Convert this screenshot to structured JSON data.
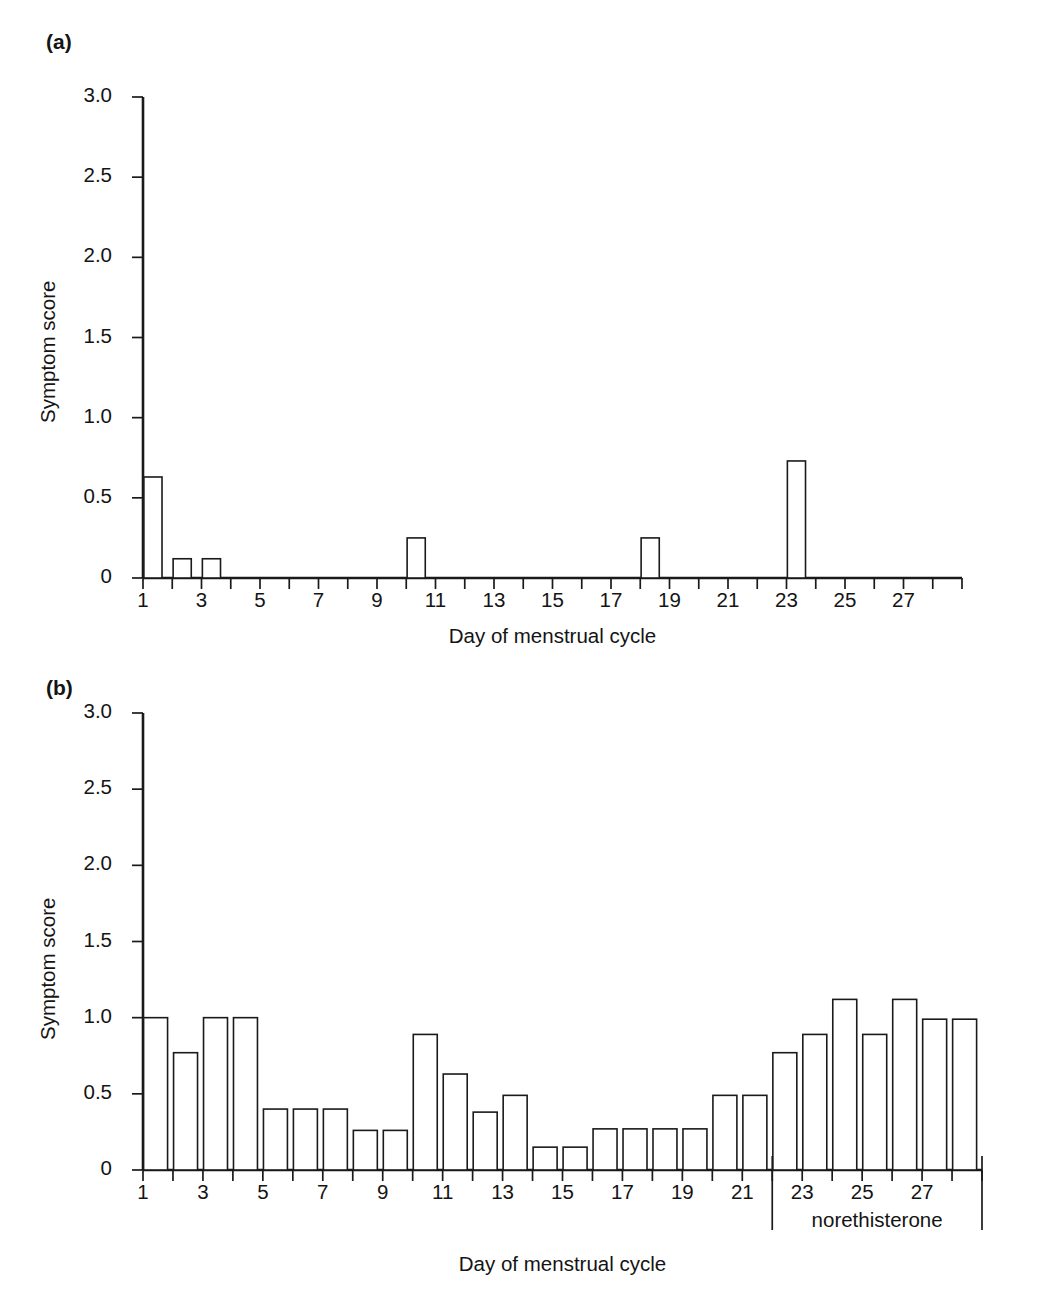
{
  "figure": {
    "panel_a_label": "(a)",
    "panel_b_label": "(b)"
  },
  "chart_data": [
    {
      "id": "panel-a",
      "type": "bar",
      "title": "(a)",
      "xlabel": "Day of menstrual cycle",
      "ylabel": "Symptom score",
      "ylim": [
        0,
        3.0
      ],
      "ytick_labels": [
        "0",
        "0.5",
        "1.0",
        "1.5",
        "2.0",
        "2.5",
        "3.0"
      ],
      "ytick_values": [
        0,
        0.5,
        1.0,
        1.5,
        2.0,
        2.5,
        3.0
      ],
      "xlim": [
        1,
        29
      ],
      "xtick_labels": [
        "1",
        "3",
        "5",
        "7",
        "9",
        "11",
        "13",
        "15",
        "17",
        "19",
        "21",
        "23",
        "25",
        "27"
      ],
      "xtick_values": [
        1,
        3,
        5,
        7,
        9,
        11,
        13,
        15,
        17,
        19,
        21,
        23,
        25,
        27
      ],
      "grid": false,
      "legend": "none",
      "categories": [
        1,
        2,
        3,
        4,
        5,
        6,
        7,
        8,
        9,
        10,
        11,
        12,
        13,
        14,
        15,
        16,
        17,
        18,
        19,
        20,
        21,
        22,
        23,
        24,
        25,
        26,
        27,
        28
      ],
      "values": [
        0.63,
        0.12,
        0.12,
        0,
        0,
        0,
        0,
        0,
        0,
        0.25,
        0,
        0,
        0,
        0,
        0,
        0,
        0,
        0.25,
        0,
        0,
        0,
        0,
        0.73,
        0,
        0,
        0,
        0,
        0
      ]
    },
    {
      "id": "panel-b",
      "type": "bar",
      "title": "(b)",
      "xlabel": "Day of menstrual cycle",
      "ylabel": "Symptom score",
      "ylim": [
        0,
        3.0
      ],
      "ytick_labels": [
        "0",
        "0.5",
        "1.0",
        "1.5",
        "2.0",
        "2.5",
        "3.0"
      ],
      "ytick_values": [
        0,
        0.5,
        1.0,
        1.5,
        2.0,
        2.5,
        3.0
      ],
      "xlim": [
        1,
        29
      ],
      "xtick_labels": [
        "1",
        "3",
        "5",
        "7",
        "9",
        "11",
        "13",
        "15",
        "17",
        "19",
        "21",
        "23",
        "25",
        "27"
      ],
      "xtick_values": [
        1,
        3,
        5,
        7,
        9,
        11,
        13,
        15,
        17,
        19,
        21,
        23,
        25,
        27
      ],
      "grid": false,
      "legend": "none",
      "categories": [
        1,
        2,
        3,
        4,
        5,
        6,
        7,
        8,
        9,
        10,
        11,
        12,
        13,
        14,
        15,
        16,
        17,
        18,
        19,
        20,
        21,
        22,
        23,
        24,
        25,
        26,
        27,
        28
      ],
      "values": [
        1.0,
        0.77,
        1.0,
        1.0,
        0.4,
        0.4,
        0.4,
        0.26,
        0.26,
        0.89,
        0.63,
        0.38,
        0.49,
        0.15,
        0.15,
        0.27,
        0.27,
        0.27,
        0.27,
        0.49,
        0.49,
        0.77,
        0.89,
        1.12,
        0.89,
        1.12,
        0.99,
        0.99
      ],
      "annotations": [
        {
          "label": "norethisterone",
          "span_start_day": 22,
          "span_end_day": 29
        }
      ]
    }
  ]
}
